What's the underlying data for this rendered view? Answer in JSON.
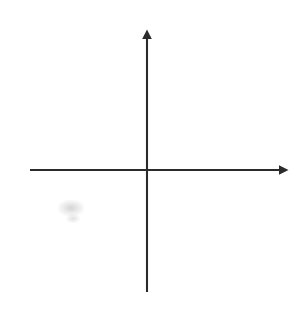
{
  "figure": {
    "kind": "cartesian-coordinate-grid",
    "background_color": "#ffffff",
    "axis_color": "#2b2b2b",
    "gridline_color": "#c9c9cf",
    "gridline_minor_color": "#dcdce2",
    "label_color": "#1d1d1d"
  },
  "chart_data": {
    "type": "scatter",
    "title": "",
    "subtitle": "",
    "xlabel": "x",
    "ylabel": "y",
    "xlim": [
      -5,
      5
    ],
    "ylim": [
      -5,
      5
    ],
    "x_ticks": [
      -5,
      -4,
      -3,
      -2,
      -1,
      1,
      2,
      3,
      4,
      5
    ],
    "y_ticks": [
      -5,
      -4,
      -3,
      -2,
      -1,
      1,
      2,
      3,
      4,
      5
    ],
    "x_tick_labels": [
      "−5",
      "−4",
      "−3",
      "−2",
      "−1",
      "1",
      "2",
      "3",
      "4",
      "5"
    ],
    "y_tick_labels": [
      "−5",
      "−4",
      "−3",
      "−2",
      "−1",
      "1",
      "2",
      "3",
      "4",
      "5"
    ],
    "grid": true,
    "grid_step": 1,
    "legend": null,
    "legend_position": "none",
    "series": [],
    "annotations": [],
    "origin_label": ""
  },
  "axes": {
    "x_axis_name": "x",
    "y_axis_name": "y",
    "x_arrow": "right-arrowhead",
    "y_arrow": "up-arrowhead"
  },
  "x_labels": [
    {
      "text": "−5",
      "value": -5
    },
    {
      "text": "−4",
      "value": -4
    },
    {
      "text": "−3",
      "value": -3
    },
    {
      "text": "−2",
      "value": -2
    },
    {
      "text": "−1",
      "value": -1
    },
    {
      "text": "1",
      "value": 1
    },
    {
      "text": "2",
      "value": 2
    },
    {
      "text": "3",
      "value": 3
    },
    {
      "text": "4",
      "value": 4
    },
    {
      "text": "5",
      "value": 5
    }
  ],
  "y_labels": [
    {
      "text": "5",
      "value": 5
    },
    {
      "text": "4",
      "value": 4
    },
    {
      "text": "3",
      "value": 3
    },
    {
      "text": "2",
      "value": 2
    },
    {
      "text": "1",
      "value": 1
    },
    {
      "text": "−1",
      "value": -1
    },
    {
      "text": "−2",
      "value": -2
    },
    {
      "text": "−3",
      "value": -3
    },
    {
      "text": "−4",
      "value": -4
    },
    {
      "text": "−5",
      "value": -5
    }
  ]
}
